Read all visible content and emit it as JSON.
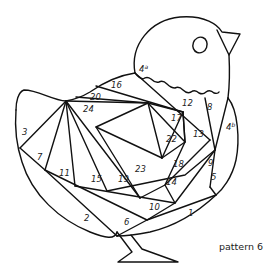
{
  "caption": "pattern 6",
  "colors": {
    "stroke": "#111111",
    "background": "#ffffff",
    "text": "#222222"
  },
  "labels": [
    {
      "id": "1",
      "text": "1",
      "x": 188,
      "y": 216
    },
    {
      "id": "2",
      "text": "2",
      "x": 84,
      "y": 221
    },
    {
      "id": "3",
      "text": "3",
      "x": 22,
      "y": 135
    },
    {
      "id": "4a",
      "text": "4",
      "sup": "a",
      "x": 139,
      "y": 72
    },
    {
      "id": "4b",
      "text": "4",
      "sup": "b",
      "x": 226,
      "y": 130
    },
    {
      "id": "5",
      "text": "5",
      "x": 211,
      "y": 180
    },
    {
      "id": "6",
      "text": "6",
      "x": 124,
      "y": 225
    },
    {
      "id": "7",
      "text": "7",
      "x": 37,
      "y": 160
    },
    {
      "id": "8",
      "text": "8",
      "x": 207,
      "y": 110
    },
    {
      "id": "9",
      "text": "9",
      "x": 208,
      "y": 166
    },
    {
      "id": "10",
      "text": "10",
      "x": 149,
      "y": 210
    },
    {
      "id": "11",
      "text": "11",
      "x": 59,
      "y": 176
    },
    {
      "id": "12",
      "text": "12",
      "x": 182,
      "y": 106
    },
    {
      "id": "13",
      "text": "13",
      "x": 193,
      "y": 137
    },
    {
      "id": "14",
      "text": "14",
      "x": 166,
      "y": 185
    },
    {
      "id": "15",
      "text": "15",
      "x": 91,
      "y": 182
    },
    {
      "id": "16",
      "text": "16",
      "x": 111,
      "y": 88
    },
    {
      "id": "17",
      "text": "17",
      "x": 171,
      "y": 121
    },
    {
      "id": "18",
      "text": "18",
      "x": 173,
      "y": 167
    },
    {
      "id": "19",
      "text": "19",
      "x": 118,
      "y": 182
    },
    {
      "id": "20",
      "text": "20",
      "x": 90,
      "y": 100
    },
    {
      "id": "22",
      "text": "22",
      "x": 166,
      "y": 142
    },
    {
      "id": "23",
      "text": "23",
      "x": 135,
      "y": 172
    },
    {
      "id": "24",
      "text": "24",
      "x": 83,
      "y": 112
    }
  ]
}
